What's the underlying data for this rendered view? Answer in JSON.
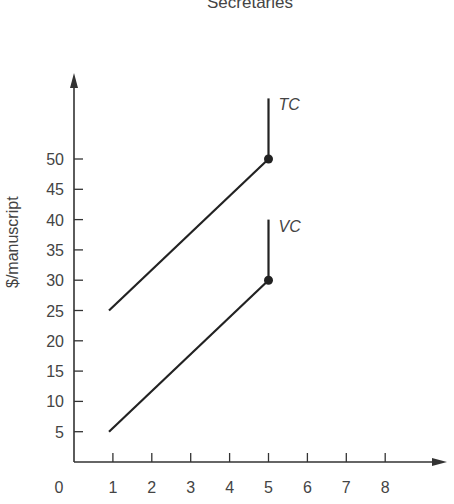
{
  "chart_data": {
    "type": "line",
    "title": "Secretaries",
    "xlabel": "",
    "ylabel": "$/manuscript",
    "origin_label": "0",
    "x_ticks": [
      1,
      2,
      3,
      4,
      5,
      6,
      7,
      8
    ],
    "y_ticks": [
      5,
      10,
      15,
      20,
      25,
      30,
      35,
      40,
      45,
      50
    ],
    "xlim": [
      0,
      9.5
    ],
    "ylim": [
      0,
      64
    ],
    "grid": false,
    "legend": "inline labels",
    "series": [
      {
        "name": "TC",
        "points": [
          [
            0.9,
            25
          ],
          [
            5,
            50
          ]
        ],
        "vertical_segment": {
          "x": 5,
          "from": 50,
          "to": 60
        },
        "endpoint_marker": [
          5,
          50
        ]
      },
      {
        "name": "VC",
        "points": [
          [
            0.9,
            5
          ],
          [
            5,
            30
          ]
        ],
        "vertical_segment": {
          "x": 5,
          "from": 30,
          "to": 40
        },
        "endpoint_marker": [
          5,
          30
        ]
      }
    ]
  },
  "colors": {
    "axis": "#333333",
    "line": "#222222",
    "text": "#444444"
  }
}
